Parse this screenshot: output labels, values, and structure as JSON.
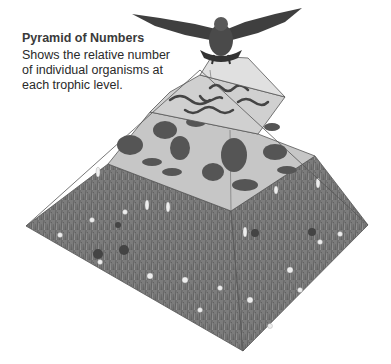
{
  "caption": {
    "title": "Pyramid of Numbers",
    "lines": [
      "Shows the relative number",
      "of individual organisms at",
      "each trophic level."
    ]
  },
  "pyramid": {
    "levels": [
      {
        "name": "top-consumer",
        "organism": "hawk",
        "count": 1
      },
      {
        "name": "tertiary-level",
        "organism": "worms/snakes",
        "count": "few"
      },
      {
        "name": "secondary-level",
        "organism": "rodents, rabbit, grasshoppers",
        "count": "many"
      },
      {
        "name": "producer-level",
        "organism": "grasses and wildflowers",
        "count": "very many"
      }
    ]
  },
  "colors": {
    "grass": "#7a7a7a",
    "tier": "#c8c8c8",
    "tier_top": "#d8d8d8",
    "edge": "#555555"
  }
}
